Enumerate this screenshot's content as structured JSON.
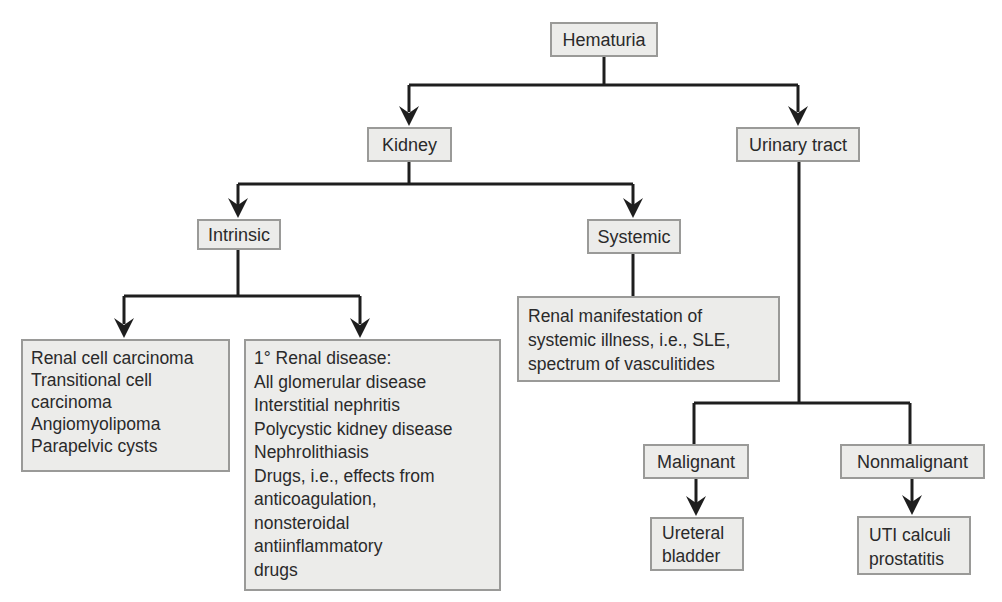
{
  "diagram": {
    "type": "flowchart",
    "root": {
      "label": "Hematuria",
      "children": [
        "Kidney",
        "Urinary tract"
      ]
    },
    "nodes": {
      "hematuria": {
        "label": "Hematuria"
      },
      "kidney": {
        "label": "Kidney"
      },
      "urinary_tract": {
        "label": "Urinary tract"
      },
      "intrinsic": {
        "label": "Intrinsic"
      },
      "systemic": {
        "label": "Systemic"
      },
      "intrinsic_tumors": {
        "lines": [
          "Renal cell carcinoma",
          "Transitional cell",
          "carcinoma",
          "Angiomyolipoma",
          "Parapelvic cysts"
        ]
      },
      "primary_renal": {
        "lines": [
          "1° Renal disease:",
          "All glomerular disease",
          "Interstitial nephritis",
          "Polycystic kidney disease",
          "Nephrolithiasis",
          "Drugs, i.e., effects from",
          "anticoagulation,",
          "nonsteroidal",
          "antiinflammatory",
          "drugs"
        ]
      },
      "systemic_illness": {
        "lines": [
          "Renal manifestation of",
          "systemic illness, i.e., SLE,",
          "spectrum of vasculitides"
        ]
      },
      "malignant": {
        "label": "Malignant"
      },
      "nonmalignant": {
        "label": "Nonmalignant"
      },
      "ureteral_bladder": {
        "lines": [
          "Ureteral",
          "bladder"
        ]
      },
      "uti_calculi": {
        "lines": [
          "UTI calculi",
          "prostatitis"
        ]
      }
    },
    "edges": [
      {
        "from": "Hematuria",
        "to": "Kidney",
        "arrow": true
      },
      {
        "from": "Hematuria",
        "to": "Urinary tract",
        "arrow": true
      },
      {
        "from": "Kidney",
        "to": "Intrinsic",
        "arrow": true
      },
      {
        "from": "Kidney",
        "to": "Systemic",
        "arrow": true
      },
      {
        "from": "Intrinsic",
        "to": "Renal cell carcinoma...",
        "arrow": true
      },
      {
        "from": "Intrinsic",
        "to": "1° Renal disease...",
        "arrow": true
      },
      {
        "from": "Systemic",
        "to": "Renal manifestation of systemic illness...",
        "arrow": false
      },
      {
        "from": "Urinary tract",
        "to": "Malignant",
        "arrow": false
      },
      {
        "from": "Urinary tract",
        "to": "Nonmalignant",
        "arrow": false
      },
      {
        "from": "Malignant",
        "to": "Ureteral bladder",
        "arrow": true
      },
      {
        "from": "Nonmalignant",
        "to": "UTI calculi prostatitis",
        "arrow": true
      }
    ],
    "colors": {
      "box_fill": "#ececea",
      "box_border": "#9a9a98",
      "line": "#1e1e1e",
      "text": "#2a2a2a",
      "background": "#ffffff"
    }
  }
}
